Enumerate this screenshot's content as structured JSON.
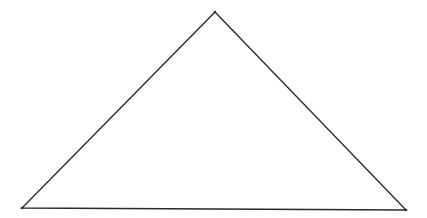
{
  "diagram": {
    "shape": "triangle",
    "stroke_color": "#2a2a2a",
    "fill_color": "none",
    "background": "#ffffff",
    "vertices": {
      "apex": [
        215,
        12
      ],
      "bottom_left": [
        22,
        208
      ],
      "bottom_right": [
        406,
        210
      ]
    }
  }
}
